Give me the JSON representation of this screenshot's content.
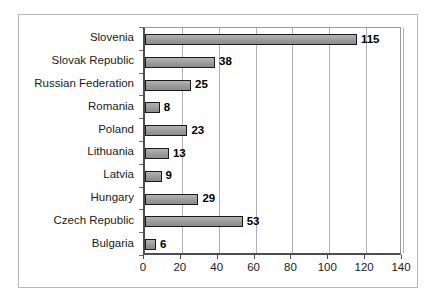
{
  "chart_data": {
    "type": "bar",
    "orientation": "horizontal",
    "title": "",
    "subtitle": "",
    "xlabel": "",
    "ylabel": "",
    "xlim": [
      0,
      140
    ],
    "xticks": [
      0,
      20,
      40,
      60,
      80,
      100,
      120,
      140
    ],
    "grid": "vertical",
    "legend": "none",
    "show_value_labels": true,
    "categories": [
      "Slovenia",
      "Slovak Republic",
      "Russian Federation",
      "Romania",
      "Poland",
      "Lithuania",
      "Latvia",
      "Hungary",
      "Czech Republic",
      "Bulgaria"
    ],
    "values": [
      115,
      38,
      25,
      8,
      23,
      13,
      9,
      29,
      53,
      6
    ],
    "value_labels": [
      "115",
      "38",
      "25",
      "8",
      "23",
      "13",
      "9",
      "29",
      "53",
      "6"
    ],
    "tick_labels": [
      "0",
      "20",
      "40",
      "60",
      "80",
      "100",
      "120",
      "140"
    ],
    "colors": {
      "bar_fill": "#9d9d9d",
      "bar_border": "#1a1a1a",
      "gridline": "#b0b0b0",
      "axis": "#4d4d4d",
      "plot_background": "#ffffff",
      "figure_border": "#b9b9b9",
      "text": "#1a1a1a"
    }
  }
}
